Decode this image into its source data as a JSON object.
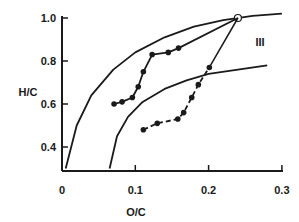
{
  "chart_data": {
    "type": "line",
    "title": "",
    "xlabel": "O/C",
    "ylabel": "H/C",
    "xlim": [
      0,
      0.3
    ],
    "ylim": [
      0.3,
      1.0
    ],
    "grid": false,
    "x_ticks": [
      "0",
      "0.1",
      "0.2",
      "0.3"
    ],
    "y_ticks": [
      "0.4",
      "0.6",
      "0.8",
      "1.0"
    ],
    "annotations": [
      {
        "text": "III",
        "x": 0.27,
        "y": 0.9
      }
    ],
    "series": [
      {
        "name": "outer boundary curve",
        "style": "solid line",
        "x": [
          0.005,
          0.02,
          0.04,
          0.07,
          0.1,
          0.14,
          0.18,
          0.22,
          0.26,
          0.3
        ],
        "y": [
          0.3,
          0.5,
          0.64,
          0.76,
          0.84,
          0.91,
          0.96,
          0.99,
          1.01,
          1.02
        ]
      },
      {
        "name": "inner boundary curve",
        "style": "solid line",
        "x": [
          0.065,
          0.075,
          0.09,
          0.11,
          0.14,
          0.17,
          0.2,
          0.24,
          0.28
        ],
        "y": [
          0.3,
          0.45,
          0.54,
          0.61,
          0.67,
          0.71,
          0.74,
          0.76,
          0.78
        ]
      },
      {
        "name": "upper data series",
        "style": "solid line with filled circles",
        "x": [
          0.071,
          0.082,
          0.096,
          0.104,
          0.111,
          0.123,
          0.145,
          0.159
        ],
        "y": [
          0.6,
          0.61,
          0.63,
          0.68,
          0.75,
          0.83,
          0.84,
          0.86
        ]
      },
      {
        "name": "lower data series",
        "style": "dashed line with filled circles",
        "x": [
          0.111,
          0.13,
          0.158,
          0.166,
          0.177,
          0.186,
          0.201
        ],
        "y": [
          0.48,
          0.51,
          0.53,
          0.56,
          0.63,
          0.69,
          0.77
        ]
      },
      {
        "name": "end point",
        "style": "open circle",
        "x": [
          0.24
        ],
        "y": [
          1.0
        ]
      }
    ]
  }
}
